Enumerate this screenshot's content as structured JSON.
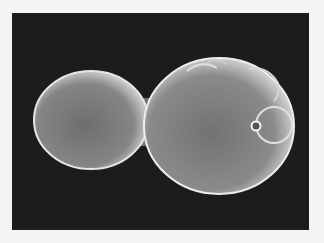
{
  "image": {
    "subject": "Scanning electron micrograph of a budding yeast cell (mother cell with attached bud)",
    "alt": "Budding yeast cell SEM",
    "colors": {
      "page_background": "#f4f4f2",
      "frame_background": "#1c1c1c",
      "cell_mid": "#7a7a7a",
      "cell_highlight": "#e8e8e8"
    }
  }
}
